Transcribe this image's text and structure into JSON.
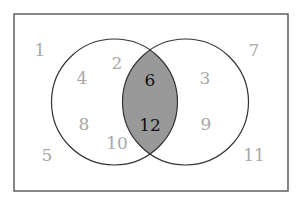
{
  "diagram": {
    "type": "venn",
    "colors": {
      "background": "#ffffff",
      "border": "#555555",
      "circle_stroke": "#333333",
      "overlap_fill": "#999999",
      "outer_text": "#a8a8a8",
      "inner_text": "#111111"
    },
    "universe": {
      "numbers": [
        {
          "value": "1",
          "x": 40,
          "y": 50
        },
        {
          "value": "5",
          "x": 47,
          "y": 155
        },
        {
          "value": "7",
          "x": 254,
          "y": 50
        },
        {
          "value": "11",
          "x": 254,
          "y": 155
        }
      ]
    },
    "left_only": {
      "numbers": [
        {
          "value": "2",
          "x": 117,
          "y": 63
        },
        {
          "value": "4",
          "x": 82,
          "y": 78
        },
        {
          "value": "8",
          "x": 84,
          "y": 124
        },
        {
          "value": "10",
          "x": 117,
          "y": 143
        }
      ]
    },
    "intersection": {
      "numbers": [
        {
          "value": "6",
          "x": 150,
          "y": 80
        },
        {
          "value": "12",
          "x": 150,
          "y": 125
        }
      ]
    },
    "right_only": {
      "numbers": [
        {
          "value": "3",
          "x": 205,
          "y": 78
        },
        {
          "value": "9",
          "x": 206,
          "y": 124
        }
      ]
    }
  }
}
